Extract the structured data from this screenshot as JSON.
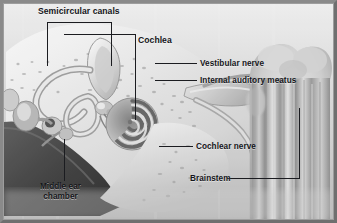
{
  "figure": {
    "border_color": "#7d7d7d",
    "ink_color": "#15161a"
  },
  "labels": {
    "semicircular_canals": "Semicircular canals",
    "cochlea": "Cochlea",
    "vestibular_nerve": "Vestibular nerve",
    "internal_auditory_meatus": "Internal auditory meatus",
    "cochlear_nerve": "Cochlear nerve",
    "brainstem": "Brainstem",
    "middle_ear_chamber": "Middle ear\nchamber"
  },
  "structures": [
    {
      "name": "semicircular-canals",
      "region": "upper-left"
    },
    {
      "name": "cochlea-spiral",
      "region": "center"
    },
    {
      "name": "vestibular-nerve",
      "region": "center-right"
    },
    {
      "name": "internal-auditory-meatus",
      "region": "center-right"
    },
    {
      "name": "cochlear-nerve",
      "region": "right"
    },
    {
      "name": "brainstem",
      "region": "far-right"
    },
    {
      "name": "middle-ear-chamber",
      "region": "lower-left"
    },
    {
      "name": "ossicles",
      "region": "left"
    },
    {
      "name": "temporal-bone",
      "region": "background"
    }
  ]
}
